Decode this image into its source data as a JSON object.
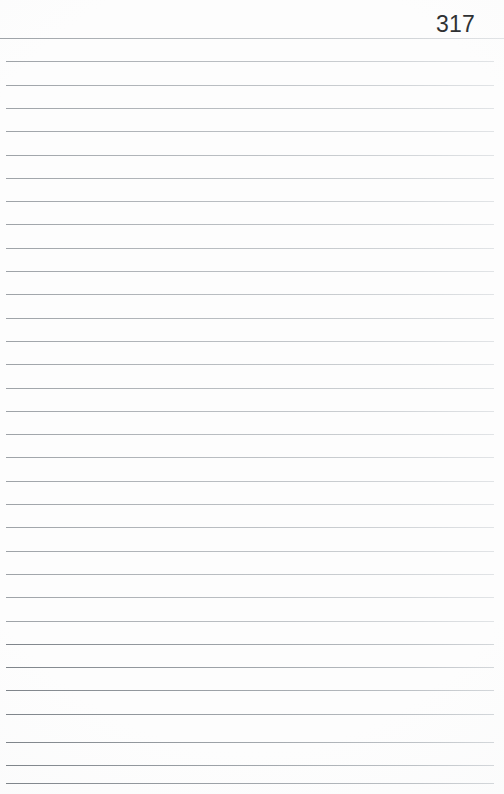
{
  "document": {
    "kind": "scanned-ruled-notebook-page",
    "page_number": "317",
    "background_color": "#fdfdfd",
    "rule_color": "#aab0b6",
    "page_number_color": "#2f3133",
    "width": 504,
    "height": 794,
    "text_content": "",
    "rules": {
      "count": 33,
      "first_y": 38,
      "spacing": 23.3,
      "inset_left": 6,
      "inset_right": 10,
      "positions": [
        38,
        61.3,
        84.6,
        107.9,
        131.2,
        154.5,
        177.8,
        201.1,
        224.4,
        247.7,
        271.0,
        294.3,
        317.6,
        340.9,
        364.2,
        387.5,
        410.8,
        434.1,
        457.4,
        480.7,
        504.0,
        527.3,
        550.6,
        573.9,
        597.2,
        620.5,
        643.8,
        667.1,
        690.4,
        713.7,
        742.0,
        765.0,
        783.0
      ]
    }
  }
}
